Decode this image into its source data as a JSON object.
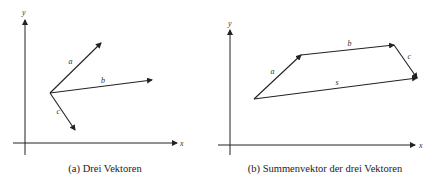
{
  "figures": [
    {
      "id": "a",
      "caption": "(a) Drei Vektoren",
      "axes": {
        "x_label": "x",
        "y_label": "y"
      },
      "vectors": [
        {
          "name": "a",
          "label": "a⃗",
          "from": [
            0,
            0
          ],
          "to": [
            51,
            50
          ]
        },
        {
          "name": "b",
          "label": "b⃗",
          "from": [
            0,
            0
          ],
          "to": [
            102,
            13
          ]
        },
        {
          "name": "c",
          "label": "c⃗",
          "from": [
            0,
            0
          ],
          "to": [
            25,
            -37
          ]
        }
      ]
    },
    {
      "id": "b",
      "caption": "(b) Summenvektor der drei Vektoren",
      "axes": {
        "x_label": "x",
        "y_label": "y"
      },
      "vectors": [
        {
          "name": "a",
          "label": "a⃗",
          "from": [
            0,
            0
          ],
          "to": [
            47,
            44
          ]
        },
        {
          "name": "b",
          "label": "b⃗",
          "from": [
            47,
            44
          ],
          "to": [
            140,
            54
          ]
        },
        {
          "name": "c",
          "label": "c⃗",
          "from": [
            140,
            54
          ],
          "to": [
            163,
            21
          ]
        },
        {
          "name": "s",
          "label": "s⃗",
          "from": [
            0,
            0
          ],
          "to": [
            163,
            21
          ]
        }
      ]
    }
  ]
}
